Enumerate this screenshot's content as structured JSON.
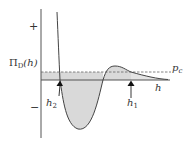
{
  "diagram": {
    "y_axis_label": "Π",
    "y_axis_label_sub": "D",
    "y_axis_label_arg": "(h)",
    "plus_sign": "+",
    "minus_sign": "−",
    "x_axis_label": "h",
    "dashed_line_label": "p",
    "dashed_line_label_sub": "c",
    "markers": [
      {
        "label": "h",
        "sub": "2"
      },
      {
        "label": "h",
        "sub": "1"
      }
    ],
    "colors": {
      "axis": "#555555",
      "curve": "#444444",
      "fill": "#d8d8d8",
      "dashed": "#666666",
      "text": "#333333"
    }
  }
}
